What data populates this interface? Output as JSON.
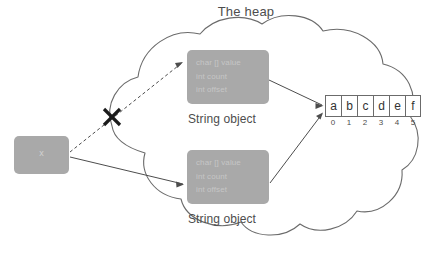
{
  "diagram": {
    "title": "The heap",
    "variable": {
      "label": "x",
      "name": "stack-variable-x"
    },
    "string_objects": [
      {
        "caption": "String object",
        "fields": [
          "char [] value",
          "int count",
          "int offset"
        ]
      },
      {
        "caption": "String object",
        "fields": [
          "char [] value",
          "int count",
          "int offset"
        ]
      }
    ],
    "char_array": {
      "cells": [
        "a",
        "b",
        "c",
        "d",
        "e",
        "f"
      ],
      "indices": [
        "0",
        "1",
        "2",
        "3",
        "4",
        "5"
      ]
    },
    "annotations": {
      "crossed_out_marker": "X"
    },
    "colors": {
      "object_fill": "#a9a9a9",
      "object_text": "#c6c6c6",
      "outline": "#6b6b6b",
      "caption_text": "#4d4d4d",
      "background": "#ffffff"
    }
  }
}
